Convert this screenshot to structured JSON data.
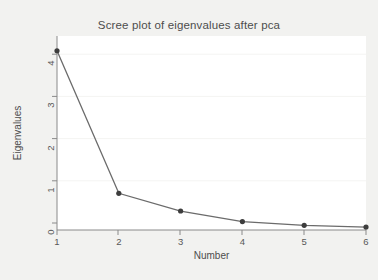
{
  "chart_data": {
    "type": "line",
    "title": "Scree plot of eigenvalues after pca",
    "xlabel": "Number",
    "ylabel": "Eigenvalues",
    "x": [
      1,
      2,
      3,
      4,
      5,
      6
    ],
    "values": [
      4.25,
      0.87,
      0.45,
      0.2,
      0.11,
      0.07
    ],
    "categories": [
      "1",
      "2",
      "3",
      "4",
      "5",
      "6"
    ],
    "xtick_labels": [
      "1",
      "2",
      "3",
      "4",
      "5",
      "6"
    ],
    "ytick_labels": [
      "0",
      "1",
      "2",
      "3",
      "4"
    ],
    "ytick_values": [
      0,
      1,
      2,
      3,
      4
    ],
    "xlim": [
      1,
      6
    ],
    "ylim": [
      0,
      4.6
    ],
    "grid": "horizontal-faint",
    "legend": "none",
    "marker": "filled-circle",
    "series": [
      {
        "name": "Eigenvalues",
        "values": [
          4.25,
          0.87,
          0.45,
          0.2,
          0.11,
          0.07
        ]
      }
    ],
    "colors": {
      "line": "#6b6b6b",
      "marker": "#3d3d3d",
      "axis": "#8a8a8a",
      "grid": "#f4f4f2",
      "plot_background": "#ffffff",
      "figure_background": "#f2f2f0",
      "text": "#4d4d4d"
    }
  }
}
